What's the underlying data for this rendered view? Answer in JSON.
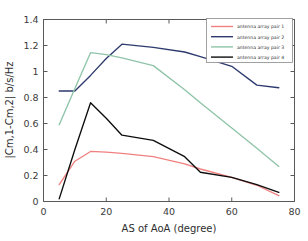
{
  "chart_data": {
    "type": "line",
    "title": "",
    "xlabel": "AS of AoA (degree)",
    "ylabel": "|Cm,1-Cm,2| b/s/Hz",
    "xlim": [
      0,
      80
    ],
    "ylim": [
      0,
      1.4
    ],
    "xticks": [
      "0",
      "20",
      "40",
      "60",
      "80"
    ],
    "xtick_values": [
      0,
      20,
      40,
      60,
      80
    ],
    "yticks": [
      "0",
      "0.2",
      "0.4",
      "0.6",
      "0.8",
      "1",
      "1.2",
      "1.4"
    ],
    "ytick_values": [
      0,
      0.2,
      0.4,
      0.6,
      0.8,
      1,
      1.2,
      1.4
    ],
    "grid": false,
    "legend_position": "top-right",
    "series": [
      {
        "name": "antenna array pair 1",
        "color": "#f08080",
        "x": [
          5,
          10,
          15,
          20,
          25,
          35,
          45,
          50,
          60,
          68,
          75
        ],
        "values": [
          0.13,
          0.31,
          0.385,
          0.38,
          0.37,
          0.345,
          0.29,
          0.25,
          0.185,
          0.125,
          0.045
        ]
      },
      {
        "name": "antenna array pair 2",
        "color": "#2d3a6e",
        "x": [
          5,
          10,
          15,
          20,
          25,
          35,
          45,
          50,
          60,
          68,
          75
        ],
        "values": [
          0.85,
          0.85,
          0.97,
          1.1,
          1.21,
          1.185,
          1.15,
          1.115,
          1.04,
          0.895,
          0.875
        ]
      },
      {
        "name": "antenna array pair 3",
        "color": "#8fc4a8",
        "x": [
          5,
          10,
          15,
          20,
          25,
          35,
          45,
          50,
          60,
          68,
          75
        ],
        "values": [
          0.59,
          0.87,
          1.145,
          1.13,
          1.105,
          1.045,
          0.86,
          0.76,
          0.565,
          0.41,
          0.27
        ]
      },
      {
        "name": "antenna array pair 4",
        "color": "#0d0d0d",
        "x": [
          5,
          10,
          15,
          20,
          25,
          35,
          45,
          50,
          60,
          68,
          75
        ],
        "values": [
          0.02,
          0.4,
          0.76,
          0.64,
          0.51,
          0.47,
          0.345,
          0.225,
          0.185,
          0.13,
          0.07
        ]
      }
    ]
  }
}
